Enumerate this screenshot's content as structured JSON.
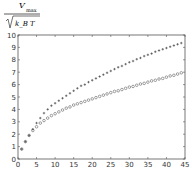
{
  "chart_data": {
    "type": "scatter",
    "title": "",
    "ylabel": "V_max / sqrt(k_B T)",
    "ylabel_parts": {
      "numerator": "V",
      "subscript": "max",
      "radicand": "k_B T"
    },
    "xlabel": "",
    "xlim": [
      0,
      45
    ],
    "ylim": [
      0,
      10
    ],
    "x_ticks": [
      0,
      5,
      10,
      15,
      20,
      25,
      30,
      35,
      40,
      45
    ],
    "y_ticks": [
      0,
      1,
      2,
      3,
      4,
      5,
      6,
      7,
      8,
      9,
      10
    ],
    "grid": false,
    "legend": null,
    "series": [
      {
        "name": "upper (plus markers)",
        "marker": "+",
        "x": [
          1,
          2,
          3,
          4,
          5,
          6,
          7,
          8,
          9,
          10,
          11,
          12,
          13,
          14,
          15,
          16,
          17,
          18,
          19,
          20,
          21,
          22,
          23,
          24,
          25,
          26,
          27,
          28,
          29,
          30,
          31,
          32,
          33,
          34,
          35,
          36,
          37,
          38,
          39,
          40,
          41,
          42,
          43,
          44
        ],
        "values": [
          0.8,
          1.4,
          1.9,
          2.4,
          2.9,
          3.3,
          3.7,
          4.0,
          4.3,
          4.5,
          4.7,
          4.9,
          5.1,
          5.3,
          5.5,
          5.7,
          5.9,
          6.0,
          6.2,
          6.35,
          6.5,
          6.65,
          6.8,
          6.95,
          7.1,
          7.25,
          7.4,
          7.5,
          7.65,
          7.8,
          7.9,
          8.05,
          8.15,
          8.3,
          8.4,
          8.5,
          8.65,
          8.75,
          8.85,
          8.95,
          9.05,
          9.15,
          9.25,
          9.35
        ]
      },
      {
        "name": "lower (circle markers)",
        "marker": "o",
        "x": [
          1,
          2,
          3,
          4,
          5,
          6,
          7,
          8,
          9,
          10,
          11,
          12,
          13,
          14,
          15,
          16,
          17,
          18,
          19,
          20,
          21,
          22,
          23,
          24,
          25,
          26,
          27,
          28,
          29,
          30,
          31,
          32,
          33,
          34,
          35,
          36,
          37,
          38,
          39,
          40,
          41,
          42,
          43,
          44
        ],
        "values": [
          0.8,
          1.4,
          1.9,
          2.3,
          2.6,
          2.9,
          3.1,
          3.3,
          3.5,
          3.65,
          3.8,
          3.95,
          4.1,
          4.2,
          4.35,
          4.45,
          4.55,
          4.65,
          4.75,
          4.85,
          4.95,
          5.05,
          5.15,
          5.25,
          5.35,
          5.45,
          5.5,
          5.6,
          5.7,
          5.8,
          5.85,
          5.95,
          6.05,
          6.1,
          6.2,
          6.3,
          6.35,
          6.45,
          6.5,
          6.6,
          6.7,
          6.75,
          6.85,
          6.95
        ]
      }
    ]
  }
}
